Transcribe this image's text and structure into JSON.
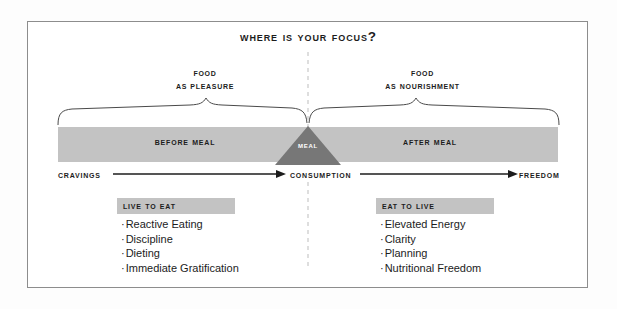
{
  "title": "Where Is Your Focus?",
  "braces": {
    "left": {
      "line1": "Food",
      "line2": "as Pleasure"
    },
    "right": {
      "line1": "Food",
      "line2": "as Nourishment"
    }
  },
  "bar": {
    "before": "Before Meal",
    "center": "Meal",
    "after": "After Meal",
    "bar_color": "#c3c3c3",
    "triangle_color": "#777777"
  },
  "axis": {
    "start": "Cravings",
    "middle": "Consumption",
    "end": "Freedom"
  },
  "panels": {
    "left": {
      "heading": "Live to Eat",
      "items": [
        "Reactive Eating",
        "Discipline",
        "Dieting",
        "Immediate Gratification"
      ]
    },
    "right": {
      "heading": "Eat to Live",
      "items": [
        "Elevated Energy",
        "Clarity",
        "Planning",
        "Nutritional Freedom"
      ]
    }
  },
  "bullet_glyph": "·",
  "colors": {
    "frame": "#8d8d8d",
    "text": "#1c1c1c",
    "divider": "#b8b8b8"
  }
}
